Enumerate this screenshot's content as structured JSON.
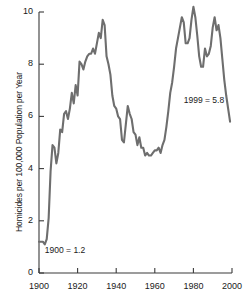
{
  "chart_data": {
    "type": "line",
    "title": "",
    "subtitle": "",
    "xlabel": "",
    "ylabel": "Homicides per 100,000 Population per Year",
    "xlim": [
      1900,
      2000
    ],
    "ylim": [
      0,
      10
    ],
    "grid": false,
    "legend": null,
    "line_color": "#6e6e6e",
    "axis_color": "#3a3a3a",
    "background": "#ffffff",
    "xticks": [
      1900,
      1920,
      1940,
      1960,
      1980,
      2000
    ],
    "xtick_labels": [
      "1900",
      "1920",
      "1940",
      "1960",
      "1980",
      "2000"
    ],
    "yticks": [
      0,
      2,
      4,
      6,
      8,
      10
    ],
    "ytick_labels": [
      "0",
      "2",
      "4",
      "6",
      "8",
      "10"
    ],
    "annotations": [
      {
        "name": "start-value-annotation",
        "text": "1900 = 1.2",
        "x": 1903,
        "y": 0.85
      },
      {
        "name": "end-value-annotation",
        "text": "1999 = 5.8",
        "x": 1975,
        "y": 6.6
      }
    ],
    "series": [
      {
        "name": "Homicide rate",
        "x": [
          1900,
          1901,
          1902,
          1903,
          1904,
          1905,
          1906,
          1907,
          1908,
          1909,
          1910,
          1911,
          1912,
          1913,
          1914,
          1915,
          1916,
          1917,
          1918,
          1919,
          1920,
          1921,
          1922,
          1923,
          1924,
          1925,
          1926,
          1927,
          1928,
          1929,
          1930,
          1931,
          1932,
          1933,
          1934,
          1935,
          1936,
          1937,
          1938,
          1939,
          1940,
          1941,
          1942,
          1943,
          1944,
          1945,
          1946,
          1947,
          1948,
          1949,
          1950,
          1951,
          1952,
          1953,
          1954,
          1955,
          1956,
          1957,
          1958,
          1959,
          1960,
          1961,
          1962,
          1963,
          1964,
          1965,
          1966,
          1967,
          1968,
          1969,
          1970,
          1971,
          1972,
          1973,
          1974,
          1975,
          1976,
          1977,
          1978,
          1979,
          1980,
          1981,
          1982,
          1983,
          1984,
          1985,
          1986,
          1987,
          1988,
          1989,
          1990,
          1991,
          1992,
          1993,
          1994,
          1995,
          1996,
          1997,
          1998,
          1999
        ],
        "values": [
          1.2,
          1.2,
          1.2,
          1.1,
          1.3,
          2.1,
          3.9,
          4.9,
          4.8,
          4.2,
          4.6,
          5.5,
          5.4,
          6.1,
          6.2,
          5.9,
          6.3,
          6.9,
          6.5,
          7.2,
          6.8,
          8.1,
          8.0,
          7.8,
          8.1,
          8.3,
          8.4,
          8.4,
          8.6,
          8.4,
          8.8,
          9.2,
          9.0,
          9.7,
          9.5,
          8.3,
          8.0,
          7.6,
          6.8,
          6.4,
          6.3,
          6.0,
          5.9,
          5.1,
          5.0,
          5.7,
          6.4,
          6.1,
          5.9,
          5.4,
          5.3,
          4.9,
          5.2,
          4.8,
          4.8,
          4.5,
          4.6,
          4.5,
          4.5,
          4.6,
          4.7,
          4.7,
          4.8,
          4.6,
          4.9,
          5.1,
          5.6,
          6.2,
          6.9,
          7.3,
          7.9,
          8.6,
          9.0,
          9.4,
          9.8,
          9.6,
          8.8,
          8.8,
          9.0,
          9.7,
          10.2,
          9.8,
          9.1,
          8.3,
          7.9,
          7.9,
          8.6,
          8.3,
          8.4,
          8.7,
          9.4,
          9.8,
          9.3,
          9.5,
          9.0,
          8.2,
          7.4,
          6.8,
          6.3,
          5.8
        ]
      }
    ]
  },
  "axis": {
    "y_title": "Homicides per 100,000 Population per Year"
  }
}
